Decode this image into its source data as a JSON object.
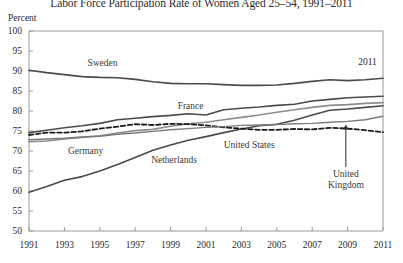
{
  "chart_data": {
    "type": "line",
    "title": "Labor Force Participation Rate of Women Aged 25–54, 1991–2011",
    "xlabel": "",
    "ylabel": "Percent",
    "xlim": [
      1991,
      2011
    ],
    "ylim": [
      50,
      100
    ],
    "ytick_step": 5,
    "xtick_step": 2,
    "grid": false,
    "legend_position": "inline-labels",
    "x": [
      1991,
      1992,
      1993,
      1994,
      1995,
      1996,
      1997,
      1998,
      1999,
      2000,
      2001,
      2002,
      2003,
      2004,
      2005,
      2006,
      2007,
      2008,
      2009,
      2010,
      2011
    ],
    "ytick_labels": [
      "50",
      "55",
      "60",
      "65",
      "70",
      "75",
      "80",
      "85",
      "90",
      "95",
      "100"
    ],
    "xtick_labels": [
      "1991",
      "1993",
      "1995",
      "1997",
      "1999",
      "2001",
      "2003",
      "2005",
      "2007",
      "2009",
      "2011"
    ],
    "series": [
      {
        "name": "Sweden",
        "style": "solid",
        "color": "#4a4a4a",
        "width": 1.6,
        "label_x": 1994.3,
        "label_y": 91.8,
        "values": [
          90.2,
          89.6,
          89.1,
          88.6,
          88.4,
          88.3,
          87.9,
          87.3,
          86.9,
          86.8,
          86.8,
          86.6,
          86.4,
          86.4,
          86.5,
          86.9,
          87.4,
          87.8,
          87.6,
          87.8,
          88.2
        ]
      },
      {
        "name": "France",
        "style": "solid",
        "color": "#4a4a4a",
        "width": 1.6,
        "label_x": 1999.4,
        "label_y": 80.9,
        "values": [
          74.6,
          75.2,
          75.8,
          76.3,
          76.9,
          77.8,
          78.2,
          78.6,
          78.9,
          79.3,
          79.0,
          80.3,
          80.7,
          81.0,
          81.4,
          81.7,
          82.5,
          82.9,
          83.3,
          83.5,
          83.7
        ]
      },
      {
        "name": "Germany",
        "style": "solid",
        "color": "#8c8c8c",
        "width": 1.6,
        "label_x": 1993.2,
        "label_y": 69.8,
        "values": [
          72.3,
          72.5,
          73.0,
          73.4,
          73.8,
          74.5,
          75.1,
          75.4,
          76.2,
          76.8,
          77.2,
          77.8,
          78.4,
          79.0,
          79.7,
          80.3,
          80.9,
          81.4,
          81.6,
          81.9,
          82.1
        ]
      },
      {
        "name": "Netherlands",
        "style": "solid",
        "color": "#4a4a4a",
        "width": 1.6,
        "label_x": 1997.9,
        "label_y": 67.5,
        "values": [
          59.7,
          61.1,
          62.7,
          63.6,
          65.0,
          66.6,
          68.4,
          70.2,
          71.5,
          72.7,
          73.6,
          74.6,
          75.5,
          76.3,
          76.7,
          77.7,
          79.0,
          80.2,
          80.5,
          80.9,
          81.3
        ]
      },
      {
        "name": "United States",
        "style": "dashed",
        "color": "#1a1a1a",
        "width": 1.8,
        "label_x": 2002.0,
        "label_y": 71.2,
        "values": [
          74.0,
          74.6,
          74.6,
          74.9,
          75.6,
          76.1,
          76.7,
          76.5,
          76.8,
          76.7,
          76.4,
          75.9,
          75.6,
          75.3,
          75.3,
          75.5,
          75.4,
          75.8,
          75.6,
          75.2,
          74.7
        ]
      },
      {
        "name": "United Kingdom",
        "style": "solid",
        "color": "#7a7a7a",
        "width": 1.4,
        "label_x": 2008.9,
        "label_y": 64.0,
        "values": [
          72.8,
          73.0,
          73.2,
          73.5,
          73.7,
          74.2,
          74.5,
          74.9,
          75.3,
          75.6,
          75.9,
          76.1,
          76.4,
          76.5,
          76.6,
          76.8,
          76.9,
          77.2,
          77.4,
          77.8,
          78.7
        ]
      }
    ],
    "annotations": [
      {
        "name": "endpoint-year",
        "text": "2011",
        "x": 2009.6,
        "y": 91.9
      },
      {
        "name": "uk-pointer-arrow",
        "text": "",
        "from_x": 2008.9,
        "from_y": 66.0,
        "to_x": 2008.9,
        "to_y": 76.6
      }
    ]
  }
}
